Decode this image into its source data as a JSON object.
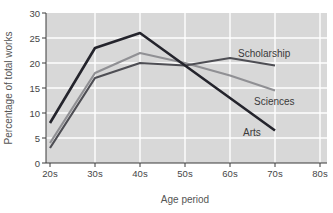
{
  "chart_data": {
    "type": "line",
    "title": "",
    "xlabel": "Age period",
    "ylabel": "Percentage of total works",
    "categories": [
      "20s",
      "30s",
      "40s",
      "50s",
      "60s",
      "70s"
    ],
    "x_tick_labels": [
      "20s",
      "30s",
      "40s",
      "50s",
      "60s",
      "70s",
      "80s"
    ],
    "y_ticks": [
      0,
      5,
      10,
      15,
      20,
      25,
      30
    ],
    "ylim": [
      0,
      30
    ],
    "grid": true,
    "legend_position": "inline-labels-right",
    "colors": {
      "plot_bg": "#d8d8d8",
      "grid": "#ffffff",
      "axis": "#3a3a3a",
      "tick_text": "#454545",
      "axis_title_text": "#555555",
      "series_label_text": "#3a3a3a"
    },
    "series": [
      {
        "name": "Sciences",
        "color": "#909094",
        "width": 2.2,
        "values": [
          4,
          18,
          22,
          20,
          17.5,
          14.5
        ]
      },
      {
        "name": "Scholarship",
        "color": "#4e4e54",
        "width": 2.2,
        "values": [
          3,
          17,
          20,
          19.5,
          21,
          19.5
        ]
      },
      {
        "name": "Arts",
        "color": "#24242c",
        "width": 2.6,
        "values": [
          8,
          23,
          26,
          19.5,
          13,
          6.5
        ]
      }
    ]
  }
}
